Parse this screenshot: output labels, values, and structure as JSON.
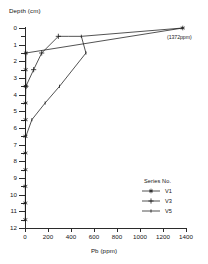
{
  "axes": {
    "ylabel": "Depth (cm)",
    "xlabel": "Pb (ppm)",
    "yticks_major": [
      "0",
      "1",
      "2",
      "3",
      "4",
      "5",
      "6",
      "7",
      "8",
      "9",
      "10",
      "11",
      "12"
    ],
    "xticks": [
      "0",
      "200",
      "400",
      "600",
      "800",
      "1000",
      "1200",
      "1400"
    ]
  },
  "legend": {
    "title": "Series No.",
    "items": [
      {
        "label": "V1",
        "marker": "asterisk-marker"
      },
      {
        "label": "V3",
        "marker": "plus-marker"
      },
      {
        "label": "V5",
        "marker": "line-marker"
      }
    ]
  },
  "annotation": {
    "offscale_value": "(1372ppm)"
  },
  "chart_data": {
    "type": "line",
    "title": "",
    "xlabel": "Pb (ppm)",
    "ylabel": "Depth (cm)",
    "xlim": [
      0,
      1400
    ],
    "ylim": [
      0,
      12
    ],
    "y_inverted": true,
    "grid": false,
    "legend_position": "lower-right",
    "legend_title": "Series No.",
    "xticks": [
      0,
      200,
      400,
      600,
      800,
      1000,
      1200,
      1400
    ],
    "yticks": [
      0,
      1,
      2,
      3,
      4,
      5,
      6,
      7,
      8,
      9,
      10,
      11,
      12
    ],
    "yticks_minor_step": 0.5,
    "annotations": [
      {
        "text": "(1372ppm)",
        "x": 1372,
        "y": 0.9,
        "note": "label for V1 surface value"
      }
    ],
    "series": [
      {
        "name": "V1",
        "marker": "asterisk",
        "points": [
          {
            "pb": 1372,
            "depth": 0
          },
          {
            "pb": 8,
            "depth": 1.5
          },
          {
            "pb": 6,
            "depth": 2.5
          },
          {
            "pb": 7,
            "depth": 3.5
          },
          {
            "pb": 5,
            "depth": 4.5
          },
          {
            "pb": 5,
            "depth": 5.5
          },
          {
            "pb": 4,
            "depth": 6.5
          },
          {
            "pb": 4,
            "depth": 7.5
          },
          {
            "pb": 4,
            "depth": 8.5
          },
          {
            "pb": 3,
            "depth": 9.5
          },
          {
            "pb": 3,
            "depth": 10.5
          },
          {
            "pb": 3,
            "depth": 11.5
          }
        ]
      },
      {
        "name": "V3",
        "marker": "plus",
        "points": [
          {
            "pb": 290,
            "depth": 0.5
          },
          {
            "pb": 145,
            "depth": 1.5
          },
          {
            "pb": 75,
            "depth": 2.5
          },
          {
            "pb": 8,
            "depth": 3.5
          }
        ]
      },
      {
        "name": "V5",
        "marker": "line",
        "points": [
          {
            "pb": 490,
            "depth": 0.5
          },
          {
            "pb": 530,
            "depth": 1.5
          },
          {
            "pb": 300,
            "depth": 3.5
          },
          {
            "pb": 175,
            "depth": 4.5
          },
          {
            "pb": 60,
            "depth": 5.5
          },
          {
            "pb": 8,
            "depth": 6.5
          }
        ]
      },
      {
        "name": "V1-surface-run",
        "marker": "none",
        "hidden_in_legend": true,
        "points": [
          {
            "pb": 290,
            "depth": 0.5
          },
          {
            "pb": 380,
            "depth": 0.5
          },
          {
            "pb": 490,
            "depth": 0.5
          },
          {
            "pb": 1372,
            "depth": 0
          }
        ]
      }
    ]
  }
}
